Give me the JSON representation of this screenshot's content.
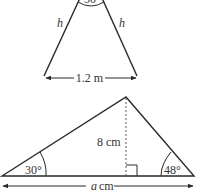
{
  "diagrams": {
    "isosceles_triangle": {
      "apex_angle_label": "30°",
      "left_side_label": "h",
      "right_side_label": "h",
      "base_label": "1.2 m"
    },
    "scalene_triangle": {
      "height_label": "8 cm",
      "left_angle_label": "30°",
      "right_angle_label": "48°",
      "base_label_var": "a",
      "base_label_unit": "cm"
    }
  },
  "colors": {
    "line": "#2a2a2a",
    "text": "#333333",
    "background": "#ffffff"
  }
}
